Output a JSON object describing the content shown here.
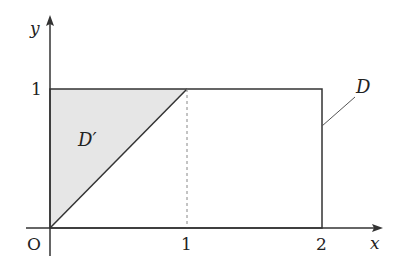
{
  "diagram": {
    "type": "region-diagram",
    "axes": {
      "x_label": "x",
      "y_label": "y",
      "origin_label": "O",
      "x_ticks": [
        "1",
        "2"
      ],
      "y_ticks": [
        "1"
      ]
    },
    "regions": [
      {
        "name": "D",
        "label": "D",
        "shape": "rectangle",
        "vertices": [
          [
            0,
            0
          ],
          [
            2,
            0
          ],
          [
            2,
            1
          ],
          [
            0,
            1
          ]
        ],
        "fill": "none"
      },
      {
        "name": "D'",
        "label": "D′",
        "shape": "triangle",
        "vertices": [
          [
            0,
            0
          ],
          [
            1,
            1
          ],
          [
            0,
            1
          ]
        ],
        "fill": "#e6e6e6"
      }
    ],
    "guides": [
      {
        "type": "dashed",
        "from": [
          1,
          0
        ],
        "to": [
          1,
          1
        ]
      }
    ],
    "colors": {
      "line": "#333333",
      "shade": "#e6e6e6",
      "dashed": "#888888"
    }
  }
}
